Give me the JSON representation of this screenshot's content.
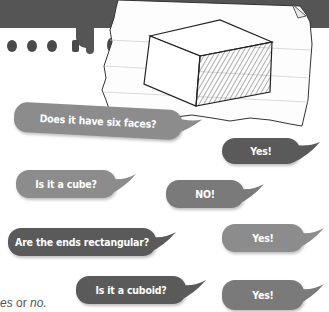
{
  "illustration": {
    "description": "Hand-drawn cuboid with shaded right end on torn lined paper",
    "shape": "cuboid"
  },
  "bubbles": [
    {
      "id": "q1",
      "text": "Does it have six faces?",
      "speaker": "question"
    },
    {
      "id": "a1",
      "text": "Yes!",
      "speaker": "answer"
    },
    {
      "id": "q2",
      "text": "Is it a cube?",
      "speaker": "question"
    },
    {
      "id": "a2",
      "text": "NO!",
      "speaker": "answer"
    },
    {
      "id": "q3",
      "text": "Are the ends rectangular?",
      "speaker": "question"
    },
    {
      "id": "a3",
      "text": "Yes!",
      "speaker": "answer"
    },
    {
      "id": "q4",
      "text": "Is it a cuboid?",
      "speaker": "question"
    },
    {
      "id": "a4",
      "text": "Yes!",
      "speaker": "answer"
    }
  ],
  "caption": {
    "pre": "es",
    "mid": " or ",
    "post": "no."
  },
  "colors": {
    "band": "#555555",
    "bubble_light": "#8c8c8c",
    "bubble_mid": "#7a7a7a",
    "bubble_dark": "#5a5a5a",
    "paper": "#ffffff"
  }
}
